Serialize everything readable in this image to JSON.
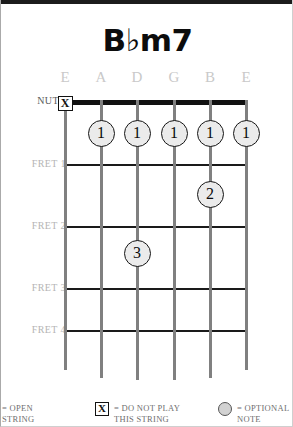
{
  "chord": {
    "title": "B♭m7",
    "nut_label": "NUT"
  },
  "strings": [
    {
      "name": "E",
      "x": 64
    },
    {
      "name": "A",
      "x": 100
    },
    {
      "name": "D",
      "x": 136
    },
    {
      "name": "G",
      "x": 173
    },
    {
      "name": "B",
      "x": 209
    },
    {
      "name": "E",
      "x": 245
    }
  ],
  "frets": [
    {
      "label": "FRET 1",
      "y": 164
    },
    {
      "label": "FRET 2",
      "y": 226
    },
    {
      "label": "FRET 3",
      "y": 288
    },
    {
      "label": "FRET 4",
      "y": 330
    }
  ],
  "markers": [
    {
      "type": "mute",
      "symbol": "X",
      "string": 0,
      "x": 64,
      "y": 103
    },
    {
      "type": "finger",
      "symbol": "1",
      "string": 1,
      "x": 100,
      "y": 133
    },
    {
      "type": "finger",
      "symbol": "1",
      "string": 2,
      "x": 136,
      "y": 133
    },
    {
      "type": "finger",
      "symbol": "1",
      "string": 3,
      "x": 173,
      "y": 133
    },
    {
      "type": "finger",
      "symbol": "1",
      "string": 4,
      "x": 209,
      "y": 133
    },
    {
      "type": "finger",
      "symbol": "1",
      "string": 5,
      "x": 245,
      "y": 133
    },
    {
      "type": "finger",
      "symbol": "2",
      "string": 4,
      "x": 209,
      "y": 194
    },
    {
      "type": "finger",
      "symbol": "3",
      "string": 2,
      "x": 136,
      "y": 253
    }
  ],
  "legend": {
    "open": {
      "line1": "= OPEN",
      "line2": "STRING"
    },
    "mute": {
      "symbol": "X",
      "line1": "= DO NOT PLAY",
      "line2": "THIS STRING"
    },
    "optional": {
      "line1": "= OPTIONAL",
      "line2": "NOTE"
    }
  },
  "colors": {
    "ink": "#111111",
    "string": "#808080",
    "muted_label": "#b5b5b5",
    "dot_fill": "#ebebeb"
  }
}
